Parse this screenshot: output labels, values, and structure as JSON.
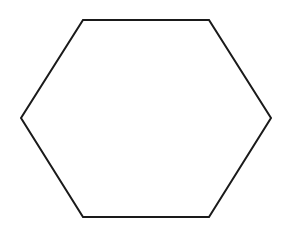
{
  "diagram": {
    "shape": "hexagon",
    "orientation": "flat-top",
    "stroke_color": "#1a1a1a",
    "fill_color": "#ffffff",
    "stroke_width": 2,
    "vertices": [
      [
        83,
        20
      ],
      [
        209,
        20
      ],
      [
        271,
        118
      ],
      [
        209,
        217
      ],
      [
        83,
        217
      ],
      [
        21,
        118
      ]
    ]
  }
}
